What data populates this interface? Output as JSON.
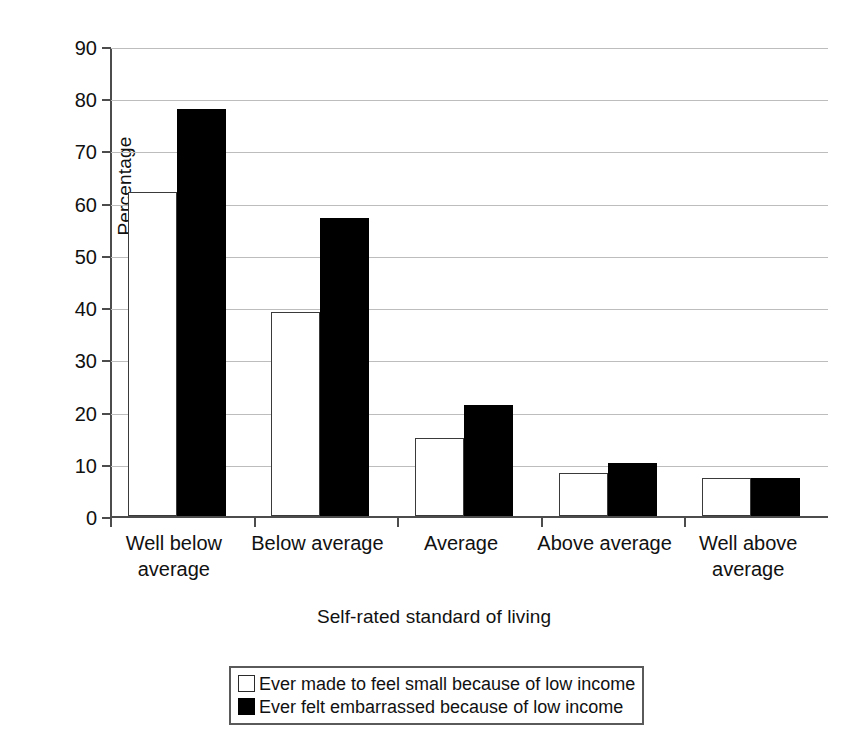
{
  "chart_data": {
    "type": "bar",
    "title": "",
    "xlabel": "Self-rated standard of living",
    "ylabel": "Percentage",
    "ylim": [
      0,
      90
    ],
    "ytick_step": 10,
    "yticks": [
      "0",
      "10",
      "20",
      "30",
      "40",
      "50",
      "60",
      "70",
      "80",
      "90"
    ],
    "grid": true,
    "legend_position": "bottom",
    "categories": [
      "Well below average",
      "Below average",
      "Average",
      "Above average",
      "Well above average"
    ],
    "series": [
      {
        "name": "Ever made to feel small because of low income",
        "swatch": "white",
        "values": [
          62,
          39,
          15,
          8.2,
          7.2
        ]
      },
      {
        "name": "Ever felt embarrassed because of low income",
        "swatch": "black",
        "values": [
          78,
          57,
          21.3,
          10.2,
          7.2
        ]
      }
    ]
  },
  "colors": {
    "series_white_fill": "#ffffff",
    "series_white_edge": "#3a3a3a",
    "series_black_fill": "#000000",
    "axis": "#4c4c4c",
    "grid": "#bdbdbd",
    "text": "#111111",
    "background": "#ffffff"
  },
  "category_lines": [
    [
      "Well below",
      "average"
    ],
    [
      "Below average",
      ""
    ],
    [
      "Average",
      ""
    ],
    [
      "Above average",
      ""
    ],
    [
      "Well above",
      "average"
    ]
  ]
}
